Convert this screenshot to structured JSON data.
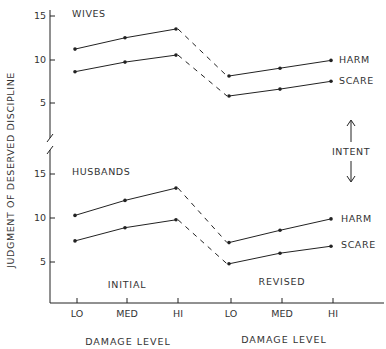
{
  "chart_data": {
    "type": "line",
    "ylabel": "JUDGMENT OF DESERVED DISCIPLINE",
    "xlabel": "DAMAGE LEVEL",
    "categories": [
      "LO",
      "MED",
      "HI"
    ],
    "phases": [
      "INITIAL",
      "REVISED"
    ],
    "annotation": "INTENT",
    "yticks": [
      5,
      10,
      15
    ],
    "panels": [
      {
        "title": "WIVES",
        "series": [
          {
            "name": "HARM",
            "initial": [
              11.2,
              12.5,
              13.5
            ],
            "revised": [
              8.1,
              9.0,
              9.9
            ]
          },
          {
            "name": "SCARE",
            "initial": [
              8.6,
              9.7,
              10.5
            ],
            "revised": [
              5.8,
              6.6,
              7.5
            ]
          }
        ]
      },
      {
        "title": "HUSBANDS",
        "series": [
          {
            "name": "HARM",
            "initial": [
              10.3,
              12.0,
              13.4
            ],
            "revised": [
              7.2,
              8.6,
              9.9
            ]
          },
          {
            "name": "SCARE",
            "initial": [
              7.4,
              8.9,
              9.8
            ],
            "revised": [
              4.8,
              6.0,
              6.8
            ]
          }
        ]
      }
    ]
  },
  "colors": {
    "line": "#222222",
    "text": "#333333",
    "background": "#ffffff"
  }
}
